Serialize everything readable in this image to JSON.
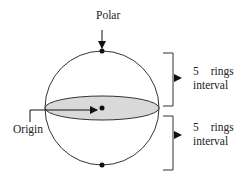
{
  "diagram": {
    "labels": {
      "polar": "Polar",
      "origin": "Origin"
    },
    "intervals": [
      {
        "line1_num": "5",
        "line1_word": "rings",
        "line2": "interval"
      },
      {
        "line1_num": "5",
        "line1_word": "rings",
        "line2": "interval"
      }
    ],
    "colors": {
      "stroke": "#333333",
      "ellipse_fill": "#d9d9d9",
      "background": "#ffffff"
    }
  }
}
